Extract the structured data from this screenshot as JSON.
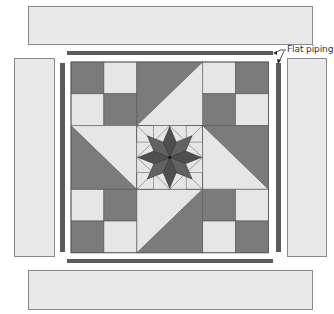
{
  "diagram": {
    "label": {
      "text": "Flat piping",
      "x": 287,
      "y": 44
    },
    "colors": {
      "panel_fill": "#e9e9e9",
      "panel_stroke": "#8a8a8a",
      "piping": "#5b5b5b",
      "patch_dark": "#7b7b7b",
      "patch_light": "#e6e6e6",
      "seam": "#555555",
      "star_dark": "#4f4f4f",
      "star_mid": "#626262",
      "leader": "#222222"
    },
    "borders": [
      {
        "name": "top-border-strip",
        "x": 28,
        "y": 6,
        "w": 284,
        "h": 38
      },
      {
        "name": "bottom-border-strip",
        "x": 28,
        "y": 270,
        "w": 284,
        "h": 39
      },
      {
        "name": "left-border-strip",
        "x": 14,
        "y": 58,
        "w": 40,
        "h": 198
      },
      {
        "name": "right-border-strip",
        "x": 287,
        "y": 58,
        "w": 39,
        "h": 198
      }
    ],
    "piping": [
      {
        "name": "top-piping",
        "x": 67,
        "y": 51,
        "w": 206,
        "h": 4
      },
      {
        "name": "bottom-piping",
        "x": 67,
        "y": 259,
        "w": 206,
        "h": 4
      },
      {
        "name": "left-piping",
        "x": 60,
        "y": 63,
        "w": 5,
        "h": 189
      },
      {
        "name": "right-piping",
        "x": 276,
        "y": 63,
        "w": 5,
        "h": 189
      }
    ],
    "block": {
      "x": 71,
      "y": 62,
      "cell_w": 32.9,
      "cell_h": 31.8,
      "four_patches": [
        {
          "name": "four-patch-top-left",
          "col": 0,
          "row": 0,
          "pattern": [
            "dark",
            "light",
            "light",
            "dark"
          ]
        },
        {
          "name": "four-patch-top-right",
          "col": 4,
          "row": 0,
          "pattern": [
            "light",
            "dark",
            "dark",
            "light"
          ]
        },
        {
          "name": "four-patch-bottom-left",
          "col": 0,
          "row": 4,
          "pattern": [
            "light",
            "dark",
            "dark",
            "light"
          ]
        },
        {
          "name": "four-patch-bottom-right",
          "col": 4,
          "row": 4,
          "pattern": [
            "dark",
            "light",
            "light",
            "dark"
          ]
        }
      ],
      "half_square_triangles": [
        {
          "name": "hst-top",
          "col": 2,
          "row": 0,
          "diagonal": "bl-tr",
          "dark": "upper-left"
        },
        {
          "name": "hst-left",
          "col": 0,
          "row": 2,
          "diagonal": "tl-br",
          "dark": "lower-left"
        },
        {
          "name": "hst-right",
          "col": 4,
          "row": 2,
          "diagonal": "tl-br",
          "dark": "upper-right"
        },
        {
          "name": "hst-bottom",
          "col": 2,
          "row": 4,
          "diagonal": "bl-tr",
          "dark": "lower-right"
        }
      ],
      "center": {
        "name": "lemoyne-star-center",
        "col": 2,
        "row": 2,
        "points": 8
      }
    }
  }
}
